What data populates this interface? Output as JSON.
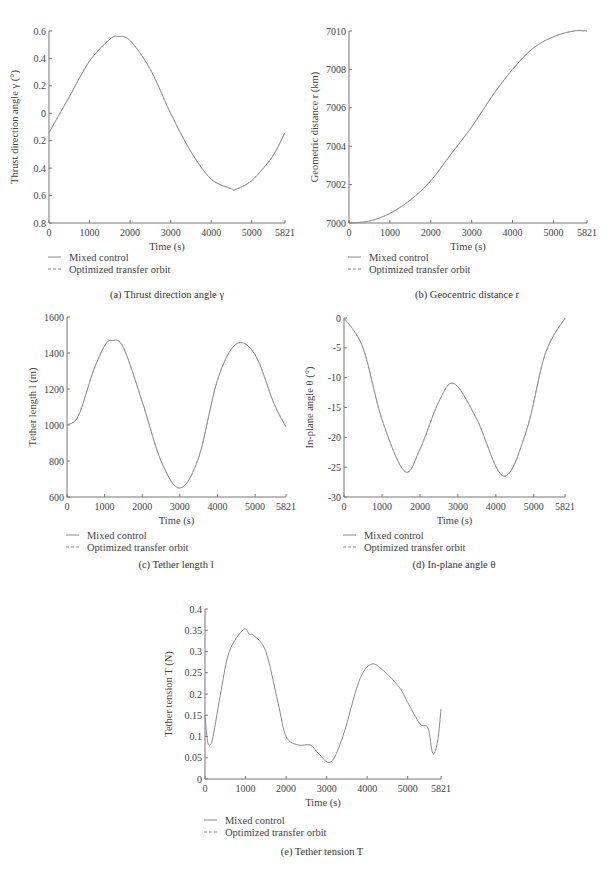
{
  "legend": {
    "series1": "Mixed control",
    "series2": "Optimized transfer orbit"
  },
  "chart_data": [
    {
      "id": "a",
      "type": "line",
      "caption": "(a) Thrust direction angle γ",
      "xlabel": "Time (s)",
      "ylabel": "Thrust direction angle γ (°)",
      "xticks": [
        "0",
        "1000",
        "2000",
        "3000",
        "4000",
        "5000",
        "5821"
      ],
      "yticks": [
        "0.6",
        "0.4",
        "0.2",
        "0",
        "0.2",
        "0.4",
        "0.6",
        "0.8"
      ],
      "xlim": [
        0,
        5821
      ],
      "ylim": [
        -0.8,
        0.6
      ],
      "series": [
        {
          "name": "Mixed control",
          "x": [
            0,
            500,
            1000,
            1500,
            1700,
            2000,
            2500,
            3000,
            3500,
            4000,
            4500,
            4600,
            5000,
            5500,
            5821
          ],
          "values": [
            -0.14,
            0.12,
            0.38,
            0.54,
            0.56,
            0.53,
            0.32,
            0.0,
            -0.28,
            -0.48,
            -0.55,
            -0.555,
            -0.49,
            -0.32,
            -0.14
          ]
        },
        {
          "name": "Optimized transfer orbit",
          "x": [
            0,
            500,
            1000,
            1500,
            1700,
            2000,
            2500,
            3000,
            3500,
            4000,
            4500,
            4600,
            5000,
            5500,
            5821
          ],
          "values": [
            -0.14,
            0.12,
            0.38,
            0.54,
            0.56,
            0.53,
            0.32,
            0.0,
            -0.28,
            -0.48,
            -0.55,
            -0.555,
            -0.49,
            -0.32,
            -0.14
          ]
        }
      ]
    },
    {
      "id": "b",
      "type": "line",
      "caption": "(b) Geocentric distance r",
      "xlabel": "Time (s)",
      "ylabel": "Geometric distance r (km)",
      "xticks": [
        "0",
        "1000",
        "2000",
        "3000",
        "4000",
        "5000",
        "5821"
      ],
      "yticks": [
        "7010",
        "7008",
        "7006",
        "7004",
        "7002",
        "7000"
      ],
      "xlim": [
        0,
        5821
      ],
      "ylim": [
        7000,
        7010
      ],
      "series": [
        {
          "name": "Mixed control",
          "x": [
            0,
            500,
            1000,
            1500,
            2000,
            2500,
            3000,
            3500,
            4000,
            4500,
            5000,
            5500,
            5821
          ],
          "values": [
            7000,
            7000.1,
            7000.5,
            7001.2,
            7002.2,
            7003.6,
            7005.0,
            7006.6,
            7008.0,
            7009.1,
            7009.7,
            7010,
            7010
          ]
        },
        {
          "name": "Optimized transfer orbit",
          "x": [
            0,
            500,
            1000,
            1500,
            2000,
            2500,
            3000,
            3500,
            4000,
            4500,
            5000,
            5500,
            5821
          ],
          "values": [
            7000,
            7000.1,
            7000.5,
            7001.2,
            7002.2,
            7003.6,
            7005.0,
            7006.6,
            7008.0,
            7009.1,
            7009.7,
            7010,
            7010
          ]
        }
      ]
    },
    {
      "id": "c",
      "type": "line",
      "caption": "(c) Tether length l",
      "xlabel": "Time (s)",
      "ylabel": "Tether length l (m)",
      "xticks": [
        "0",
        "1000",
        "2000",
        "3000",
        "4000",
        "5000",
        "5821"
      ],
      "yticks": [
        "1600",
        "1400",
        "1200",
        "1000",
        "800",
        "600"
      ],
      "xlim": [
        0,
        5821
      ],
      "ylim": [
        600,
        1600
      ],
      "series": [
        {
          "name": "Mixed control",
          "x": [
            0,
            300,
            700,
            1000,
            1200,
            1500,
            2000,
            2500,
            3000,
            3500,
            4000,
            4500,
            5000,
            5500,
            5821
          ],
          "values": [
            1000,
            1050,
            1300,
            1440,
            1470,
            1430,
            1130,
            800,
            650,
            820,
            1250,
            1450,
            1390,
            1120,
            990
          ]
        },
        {
          "name": "Optimized transfer orbit",
          "x": [
            0,
            300,
            700,
            1000,
            1200,
            1500,
            2000,
            2500,
            3000,
            3500,
            4000,
            4500,
            5000,
            5500,
            5821
          ],
          "values": [
            1000,
            1050,
            1300,
            1440,
            1470,
            1430,
            1130,
            800,
            650,
            820,
            1250,
            1450,
            1390,
            1120,
            990
          ]
        }
      ]
    },
    {
      "id": "d",
      "type": "line",
      "caption": "(d) In-plane angle θ",
      "xlabel": "Time (s)",
      "ylabel": "In-plane angle θ (°)",
      "xticks": [
        "0",
        "1000",
        "2000",
        "3000",
        "4000",
        "5000",
        "5821"
      ],
      "yticks": [
        "0",
        "-5",
        "-10",
        "-15",
        "-20",
        "-25",
        "-30"
      ],
      "xlim": [
        0,
        5821
      ],
      "ylim": [
        -30,
        0
      ],
      "series": [
        {
          "name": "Mixed control",
          "x": [
            0,
            500,
            1000,
            1600,
            2000,
            2500,
            2900,
            3500,
            4200,
            4800,
            5300,
            5821
          ],
          "values": [
            0,
            -5,
            -17,
            -25.7,
            -22,
            -14,
            -11,
            -17,
            -26.5,
            -19,
            -6,
            0
          ]
        },
        {
          "name": "Optimized transfer orbit",
          "x": [
            0,
            500,
            1000,
            1600,
            2000,
            2500,
            2900,
            3500,
            4200,
            4800,
            5300,
            5821
          ],
          "values": [
            0,
            -5,
            -17,
            -25.7,
            -22,
            -14,
            -11,
            -17,
            -26.5,
            -19,
            -6,
            0
          ]
        }
      ]
    },
    {
      "id": "e",
      "type": "line",
      "caption": "(e) Tether tension T",
      "xlabel": "Time (s)",
      "ylabel": "Tether tension T (N)",
      "xticks": [
        "0",
        "1000",
        "2000",
        "3000",
        "4000",
        "5000",
        "5821"
      ],
      "yticks": [
        "0.4",
        "0.35",
        "0.3",
        "0.25",
        "0.2",
        "0.15",
        "0.1",
        "0.05",
        "0"
      ],
      "xlim": [
        0,
        5821
      ],
      "ylim": [
        0,
        0.4
      ],
      "series": [
        {
          "name": "Mixed control",
          "x": [
            0,
            60,
            120,
            200,
            400,
            600,
            950,
            1100,
            1200,
            1500,
            1800,
            2000,
            2300,
            2600,
            2800,
            3100,
            3400,
            3800,
            4100,
            4400,
            4800,
            5000,
            5300,
            5500,
            5620,
            5740,
            5821
          ],
          "values": [
            0.15,
            0.09,
            0.08,
            0.1,
            0.21,
            0.3,
            0.352,
            0.34,
            0.338,
            0.3,
            0.18,
            0.1,
            0.08,
            0.08,
            0.06,
            0.04,
            0.1,
            0.23,
            0.27,
            0.255,
            0.215,
            0.18,
            0.13,
            0.12,
            0.06,
            0.09,
            0.165
          ]
        },
        {
          "name": "Optimized transfer orbit",
          "x": [],
          "values": []
        }
      ]
    }
  ]
}
